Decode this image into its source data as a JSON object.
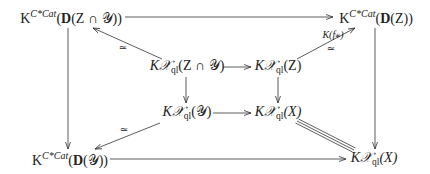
{
  "diagram": {
    "type": "commutative-diagram",
    "nodes": {
      "outer_tl": {
        "prefix": "K",
        "sup": "C*Cat",
        "bold": "D",
        "arg": "(Z ∩ 𝒴))",
        "open": "("
      },
      "outer_tr": {
        "prefix": "K",
        "sup": "C*Cat",
        "bold": "D",
        "arg": "(Z))",
        "open": "("
      },
      "outer_bl": {
        "prefix": "K",
        "sup": "C*Cat",
        "bold": "D",
        "arg": "(𝒴))",
        "open": "("
      },
      "outer_br": {
        "prefix": "K𝒳",
        "sub": "ql",
        "arg": "(X)"
      },
      "inner_tl": {
        "prefix": "K𝒳",
        "sub": "ql",
        "arg": "(Z ∩ 𝒴)"
      },
      "inner_tr": {
        "prefix": "K𝒳",
        "sub": "ql",
        "arg": "(Z)"
      },
      "inner_bl": {
        "prefix": "K𝒳",
        "sub": "ql",
        "arg": "(𝒴)"
      },
      "inner_br": {
        "prefix": "K𝒳",
        "sub": "ql",
        "arg": "(X)"
      }
    },
    "labels": {
      "iso_tl": "≃",
      "iso_tr": "≃",
      "iso_bl": "≃",
      "k_fstar": "K(f⁎)"
    },
    "edges": [
      {
        "from": "outer_tl",
        "to": "outer_tr",
        "style": "arrow"
      },
      {
        "from": "outer_tl",
        "to": "outer_bl",
        "style": "arrow"
      },
      {
        "from": "outer_tr",
        "to": "outer_br",
        "style": "arrow"
      },
      {
        "from": "outer_bl",
        "to": "outer_br",
        "style": "arrow"
      },
      {
        "from": "inner_tl",
        "to": "outer_tl",
        "style": "arrow",
        "label": "≃"
      },
      {
        "from": "inner_tr",
        "to": "outer_tr",
        "style": "arrow",
        "label": "K(f⁎) ≃"
      },
      {
        "from": "inner_bl",
        "to": "outer_bl",
        "style": "arrow",
        "label": "≃"
      },
      {
        "from": "inner_br",
        "to": "outer_br",
        "style": "equals"
      },
      {
        "from": "inner_tl",
        "to": "inner_tr",
        "style": "arrow"
      },
      {
        "from": "inner_tl",
        "to": "inner_bl",
        "style": "arrow"
      },
      {
        "from": "inner_tr",
        "to": "inner_br",
        "style": "arrow"
      },
      {
        "from": "inner_bl",
        "to": "inner_br",
        "style": "arrow"
      }
    ]
  }
}
